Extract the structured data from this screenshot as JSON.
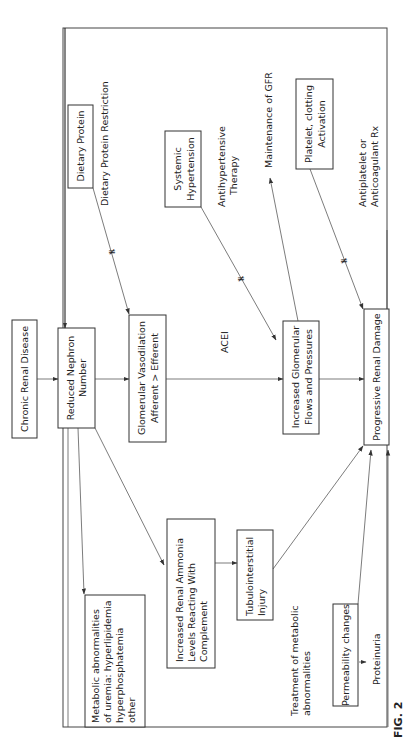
{
  "figure": {
    "label": "FIG. 2",
    "orientation": "rotated 90° counter-clockwise",
    "nodes": {
      "chronic_renal_disease": [
        "Chronic Renal Disease"
      ],
      "reduced_nephron": [
        "Reduced Nephron",
        "Number"
      ],
      "glomerular_vasodilation": [
        "Glomerular Vasodilation",
        "Afferent > Efferent"
      ],
      "increased_glomerular": [
        "Increased Glomerular",
        "Flows and Pressures"
      ],
      "progressive_damage": [
        "Progressive Renal Damage"
      ],
      "dietary_protein": [
        "Dietary Protein"
      ],
      "systemic_hypertension": [
        "Systemic",
        "Hypertension"
      ],
      "platelet": [
        "Platelet, clotting",
        "Activation"
      ],
      "metabolic": [
        "Metabolic abnormalities",
        "of uremia: hyperlipidemia",
        "hyperphosphatemia",
        "other"
      ],
      "renal_ammonia": [
        "Increased Renal Ammonia",
        "Levels Reacting With",
        "Complement"
      ],
      "tubulointerstitial": [
        "Tubulointerstitial",
        "Injury"
      ],
      "permeability": [
        "Permeability changes"
      ]
    },
    "labels": {
      "dietary_restriction": [
        "Dietary Protein Restriction"
      ],
      "antihypertensive": [
        "Antihypertensive",
        "Therapy"
      ],
      "maintenance_gfr": [
        "Maintenance of GFR"
      ],
      "antiplatelet": [
        "Antiplatelet or",
        "Anticoagulant Rx"
      ],
      "acei": [
        "ACEI"
      ],
      "treatment_metabolic": [
        "Treatment of metabolic",
        "abnormalities"
      ],
      "proteinuria": [
        "Proteinuria"
      ]
    },
    "edges": [
      {
        "from": "Chronic Renal Disease",
        "to": "Reduced Nephron Number"
      },
      {
        "from": "Reduced Nephron Number",
        "to": "Glomerular Vasodilation"
      },
      {
        "from": "Glomerular Vasodilation",
        "to": "Increased Glomerular Flows and Pressures",
        "label": "ACEI"
      },
      {
        "from": "Increased Glomerular Flows and Pressures",
        "to": "Progressive Renal Damage"
      },
      {
        "from": "Dietary Protein",
        "to": "Glomerular Vasodilation",
        "blocked_by": "Dietary Protein Restriction"
      },
      {
        "from": "Systemic Hypertension",
        "to": "Increased Glomerular Flows and Pressures",
        "blocked_by": "Antihypertensive Therapy"
      },
      {
        "from": "Increased Glomerular Flows and Pressures",
        "to": "Maintenance of GFR"
      },
      {
        "from": "Platelet, clotting Activation",
        "to": "Progressive Renal Damage",
        "blocked_by": "Antiplatelet or Anticoagulant Rx"
      },
      {
        "from": "Reduced Nephron Number",
        "to": "Increased Renal Ammonia Levels"
      },
      {
        "from": "Reduced Nephron Number",
        "to": "Metabolic abnormalities of uremia"
      },
      {
        "from": "Increased Renal Ammonia Levels",
        "to": "Tubulointerstitial Injury"
      },
      {
        "from": "Tubulointerstitial Injury",
        "to": "Progressive Renal Damage"
      },
      {
        "from": "Permeability changes",
        "to": "Progressive Renal Damage"
      },
      {
        "from": "Permeability changes",
        "to": "Proteinuria"
      },
      {
        "from": "Progressive Renal Damage",
        "to": "Reduced Nephron Number",
        "via": "feedback loop around frame"
      }
    ]
  }
}
